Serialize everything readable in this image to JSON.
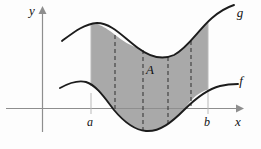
{
  "figure": {
    "background_color": "#fdfdfd",
    "axes": {
      "x_label": "x",
      "y_label": "y",
      "axis_color": "#8e8e8e",
      "origin": {
        "x": 42,
        "y": 108
      },
      "x_axis_extent": [
        6,
        243
      ],
      "y_axis_extent": [
        130,
        8
      ]
    },
    "labels": {
      "curve_upper": "g",
      "curve_lower": "f",
      "region": "A",
      "bound_left": "a",
      "bound_right": "b"
    },
    "region": {
      "name": "A",
      "fill_color": "#a9a9a9",
      "left_bound_x": 91,
      "right_bound_x": 208
    },
    "curves": {
      "upper": {
        "name": "g",
        "stroke_color": "#1c1c1c",
        "path": "M 62,41 C 74,32 84,24 97,23 C 112,23 124,38 138,48 C 150,57 163,60 174,55 C 188,48 198,30 212,18 C 220,11 228,7 234,5"
      },
      "lower": {
        "name": "f",
        "stroke_color": "#1c1c1c",
        "path": "M 60,88 C 69,83 78,80 86,82 C 96,85 104,97 114,110 C 124,122 134,130 146,131 C 160,132 172,122 184,110 C 196,98 208,89 220,86 C 228,84 234,84 238,84"
      }
    },
    "dashed_lines": [
      {
        "x": 115,
        "y_top": 36,
        "y_bottom": 112
      },
      {
        "x": 143,
        "y_top": 51,
        "y_bottom": 129
      },
      {
        "x": 168,
        "y_top": 58,
        "y_bottom": 126
      },
      {
        "x": 191,
        "y_top": 43,
        "y_bottom": 106
      }
    ],
    "tick_guides": [
      {
        "x": 91,
        "y_top": 92,
        "y_bottom": 112
      },
      {
        "x": 208,
        "y_top": 92,
        "y_bottom": 112
      }
    ],
    "label_positions": {
      "g": {
        "x": 240,
        "y": 16
      },
      "f": {
        "x": 240,
        "y": 84
      },
      "A": {
        "x": 150,
        "y": 73
      },
      "a": {
        "x": 87,
        "y": 124
      },
      "b": {
        "x": 205,
        "y": 124
      },
      "x": {
        "x": 238,
        "y": 124
      },
      "y": {
        "x": 31,
        "y": 14
      }
    }
  }
}
